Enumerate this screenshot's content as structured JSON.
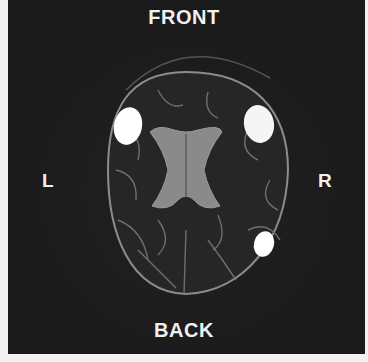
{
  "figure": {
    "type": "axial brain MRI slice",
    "labels": {
      "top": "FRONT",
      "bottom": "BACK",
      "left": "L",
      "right": "R"
    },
    "colors": {
      "background": "#1c1c1c",
      "label_text": "#f0f0f0",
      "ventricles": "#8a8a8a",
      "lesions": "#ffffff",
      "brain_outline": "#9a9a9a"
    },
    "lesions": [
      {
        "position": "left frontal",
        "shape": "oval"
      },
      {
        "position": "right frontal",
        "shape": "oval"
      },
      {
        "position": "right posterior",
        "shape": "oval"
      }
    ]
  }
}
